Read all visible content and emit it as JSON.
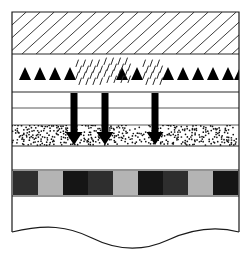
{
  "figure": {
    "width": 251,
    "height": 258,
    "background": "#ffffff",
    "frame": {
      "name": "column-outline",
      "x": 12,
      "y": 12,
      "width": 227,
      "height": 232,
      "stroke": "#1a1a1a",
      "stroke_width": 1.2,
      "fill": "#ffffff"
    },
    "colors": {
      "line": "#1a1a1a",
      "thin_line": "#4a4a4a",
      "hatch": "#3c3c3c",
      "stipple": "#1a1a1a",
      "arrow": "#000000",
      "block_dark": "#2e2e2e",
      "block_darker": "#151515",
      "block_light": "#b4b4b4",
      "white": "#ffffff"
    },
    "layers": [
      {
        "name": "hatched-layer",
        "pattern": "diagonal-hatch",
        "y": 12,
        "height": 42,
        "fill": "#ffffff",
        "hatch_spacing": 14,
        "hatch_angle": 60
      },
      {
        "name": "clast-rain-layer",
        "pattern": "triangles-and-dashes",
        "y": 54,
        "height": 38,
        "fill": "#ffffff"
      },
      {
        "name": "upper-white-layer",
        "pattern": "blank",
        "y": 92,
        "height": 16,
        "fill": "#ffffff"
      },
      {
        "name": "middle-white-layer",
        "pattern": "blank",
        "y": 108,
        "height": 17,
        "fill": "#ffffff"
      },
      {
        "name": "stippled-sand-layer",
        "pattern": "stipple",
        "y": 125,
        "height": 21,
        "fill": "#ffffff"
      },
      {
        "name": "lower-white-layer",
        "pattern": "blank",
        "y": 146,
        "height": 24,
        "fill": "#ffffff"
      },
      {
        "name": "checkerboard-layer",
        "pattern": "alternating-blocks",
        "y": 170,
        "height": 26,
        "fill": "#ffffff"
      },
      {
        "name": "basal-white-layer",
        "pattern": "blank-with-wavy-base",
        "y": 196,
        "height": 48,
        "fill": "#ffffff"
      }
    ],
    "separators": [
      {
        "name": "separator-hatch-base",
        "y": 54,
        "stroke": "#2a2a2a",
        "width": 1.2
      },
      {
        "name": "separator-clast-base",
        "y": 92,
        "stroke": "#2a2a2a",
        "width": 1.2
      },
      {
        "name": "separator-upper-white",
        "y": 108,
        "stroke": "#5a5a5a",
        "width": 1.0
      },
      {
        "name": "separator-stipple-top",
        "y": 125,
        "stroke": "#5a5a5a",
        "width": 1.0
      },
      {
        "name": "separator-stipple-base",
        "y": 146,
        "stroke": "#2a2a2a",
        "width": 1.2
      },
      {
        "name": "separator-block-top",
        "y": 170,
        "stroke": "#2a2a2a",
        "width": 1.0
      },
      {
        "name": "separator-block-base",
        "y": 196,
        "stroke": "#2a2a2a",
        "width": 1.0
      }
    ],
    "triangles": {
      "name": "clast-triangles",
      "baseline_y": 80,
      "width": 12,
      "height": 13,
      "fill": "#000000",
      "x_positions": [
        19,
        34,
        49,
        64,
        116,
        131,
        162,
        177,
        192,
        207,
        222,
        234
      ]
    },
    "rain_clusters": {
      "name": "rain-dash-clusters",
      "dash_length": 7,
      "dash_angle": 70,
      "stroke": "#2a2a2a",
      "stroke_width": 1.0,
      "clusters": [
        {
          "x": 76,
          "y": 60,
          "cols": 4,
          "rows": 4,
          "dx": 7,
          "dy": 6
        },
        {
          "x": 104,
          "y": 58,
          "cols": 4,
          "rows": 4,
          "dx": 7,
          "dy": 6
        },
        {
          "x": 143,
          "y": 60,
          "cols": 3,
          "rows": 4,
          "dx": 7,
          "dy": 6
        }
      ]
    },
    "arrows": {
      "name": "infiltration-arrows",
      "count": 3,
      "shaft_width": 7,
      "head_width": 17,
      "head_height": 13,
      "top_y": 93,
      "tip_y": 145,
      "fill": "#000000",
      "x_centers": [
        74,
        105,
        155
      ]
    },
    "stipple": {
      "name": "sand-stipple-pattern",
      "dot_radius": 0.85,
      "dot_color": "#111111",
      "density": 0.5,
      "seed": 20240117
    },
    "blocks": {
      "name": "alternating-block-band",
      "y": 171,
      "height": 24,
      "start_x": 13,
      "end_x": 238,
      "count": 9,
      "sequence": [
        "#2e2e2e",
        "#b4b4b4",
        "#151515",
        "#2e2e2e",
        "#b4b4b4",
        "#151515",
        "#2e2e2e",
        "#b4b4b4",
        "#151515"
      ]
    },
    "wavy_base": {
      "name": "erosional-wavy-boundary",
      "stroke": "#1a1a1a",
      "stroke_width": 1.2,
      "start": {
        "x": 12,
        "y": 232
      },
      "path": "M12,232 C46,224 68,226 92,238 C118,251 142,252 168,240 C192,229 216,226 239,232"
    }
  }
}
